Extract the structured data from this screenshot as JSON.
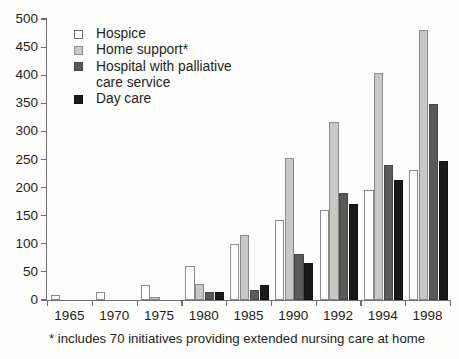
{
  "chart_data": {
    "type": "bar",
    "title": "",
    "xlabel": "",
    "ylabel": "",
    "ylim": [
      0,
      500
    ],
    "ytick_step": 50,
    "grid": false,
    "legend_position": "top-left",
    "categories": [
      "1965",
      "1970",
      "1975",
      "1980",
      "1985",
      "1990",
      "1992",
      "1994",
      "1998"
    ],
    "yticks": [
      "0",
      "50",
      "100",
      "150",
      "200",
      "250",
      "300",
      "350",
      "400",
      "450",
      "500"
    ],
    "series": [
      {
        "name": "Hospice",
        "color": "#ffffff",
        "values": [
          9,
          15,
          27,
          61,
          100,
          142,
          160,
          195,
          231
        ]
      },
      {
        "name": "Home support*",
        "color": "#c9c9c4",
        "values": [
          0,
          0,
          6,
          29,
          116,
          252,
          316,
          404,
          481
        ]
      },
      {
        "name": "Hospital with palliative care service",
        "color": "#5a5a57",
        "values": [
          0,
          0,
          0,
          15,
          17,
          81,
          190,
          240,
          349
        ]
      },
      {
        "name": "Day care",
        "color": "#1a1a1a",
        "values": [
          0,
          0,
          0,
          14,
          27,
          65,
          171,
          213,
          248
        ]
      }
    ],
    "annotations": [
      "* includes 70 initiatives providing extended nursing care at home"
    ]
  },
  "legend": {
    "items": [
      {
        "label": "Hospice",
        "swatch": "legend-swatch-hospice"
      },
      {
        "label": "Home support*",
        "swatch": "legend-swatch-home-support"
      },
      {
        "label": "Hospital with palliative",
        "swatch": "legend-swatch-hospital-palliative"
      },
      {
        "label": "care service",
        "swatch": ""
      },
      {
        "label": "Day care",
        "swatch": "legend-swatch-day-care"
      }
    ]
  },
  "footnote": {
    "text": "* includes 70 initiatives providing extended nursing care at home"
  }
}
